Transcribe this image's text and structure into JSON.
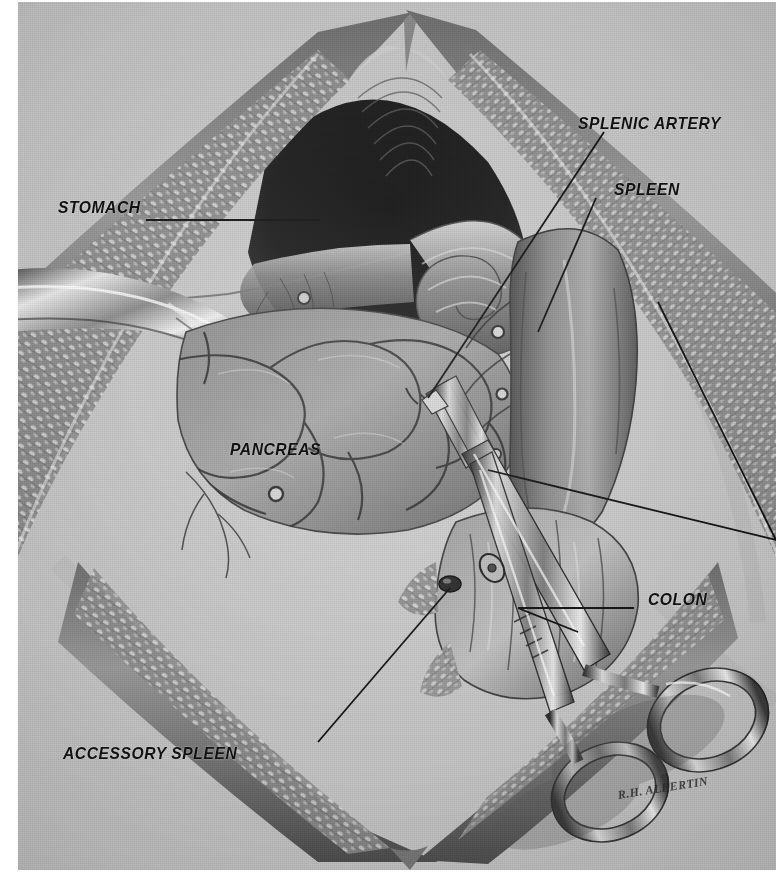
{
  "plate": {
    "title": "Operative exposure of the pancreas and splenic artery",
    "background_color": "#c9c9c9",
    "ink_color": "#111111",
    "medium": "halftone pen-and-wash medical illustration"
  },
  "artist": {
    "signature": "R.H. ALBERTIN",
    "name": "R. H. Albertin"
  },
  "labels": [
    {
      "id": "stomach",
      "text": "STOMACH",
      "leader": "horizontal-right"
    },
    {
      "id": "splenic-artery",
      "text": "SPLENIC ARTERY",
      "leader": "diagonal-down-left"
    },
    {
      "id": "spleen",
      "text": "SPLEEN",
      "leader": "diagonal-down-left"
    },
    {
      "id": "pancreas",
      "text": "PANCREAS",
      "leader": "none"
    },
    {
      "id": "colon",
      "text": "COLON",
      "leader": "horizontal-left"
    },
    {
      "id": "accessory-spleen",
      "text": "ACCESSORY SPLEEN",
      "leader": "diagonal-up-right"
    }
  ],
  "structures": [
    {
      "id": "abdominal-wall",
      "name": "Retracted abdominal wall",
      "note": "inverted V, cut fatty edge"
    },
    {
      "id": "peritoneal-cavity",
      "name": "Peritoneal cavity",
      "note": "dark recess beneath wall"
    },
    {
      "id": "stomach-body",
      "name": "Stomach",
      "note": "curled upper organ"
    },
    {
      "id": "pancreas-body",
      "name": "Pancreas",
      "note": "lobulated gland, central"
    },
    {
      "id": "spleen-body",
      "name": "Spleen",
      "note": "smooth mass, right"
    },
    {
      "id": "colon-loop",
      "name": "Colon",
      "note": "lower right loop"
    },
    {
      "id": "accessory-spleen-nodule",
      "name": "Accessory spleen",
      "note": "small dark nodule"
    },
    {
      "id": "retractor-left",
      "name": "Retractor blade",
      "note": "metal, left margin"
    },
    {
      "id": "hemostat",
      "name": "Hemostat forceps",
      "note": "two ring handles, box lock, long jaws"
    }
  ]
}
